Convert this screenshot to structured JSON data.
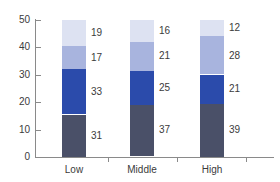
{
  "chart_data": {
    "type": "bar",
    "stacked": true,
    "title": "",
    "subtitle": "",
    "xlabel": "",
    "ylabel": "",
    "ylim": [
      0,
      50
    ],
    "yticks": [
      0,
      10,
      20,
      30,
      40,
      50
    ],
    "ytick_labels": [
      "0",
      "10",
      "20",
      "30",
      "40",
      "50"
    ],
    "grid": false,
    "legend": "none",
    "categories": [
      "Low",
      "Middle",
      "High"
    ],
    "series": [
      {
        "name": "series-1-bottom",
        "color": "#4a5068",
        "values": [
          31,
          37,
          39
        ]
      },
      {
        "name": "series-2",
        "color": "#2b4bab",
        "values": [
          33,
          25,
          21
        ]
      },
      {
        "name": "series-3",
        "color": "#a8b4de",
        "values": [
          17,
          21,
          28
        ]
      },
      {
        "name": "series-4-top",
        "color": "#dde2f2",
        "values": [
          19,
          16,
          12
        ]
      }
    ],
    "bars": [
      {
        "category": "Low",
        "segments": [
          {
            "label": "19",
            "value": 19,
            "color": "#dde2f2"
          },
          {
            "label": "17",
            "value": 17,
            "color": "#a8b4de"
          },
          {
            "label": "33",
            "value": 33,
            "color": "#2b4bab"
          },
          {
            "label": "31",
            "value": 31,
            "color": "#4a5068"
          }
        ]
      },
      {
        "category": "Middle",
        "segments": [
          {
            "label": "16",
            "value": 16,
            "color": "#dde2f2"
          },
          {
            "label": "21",
            "value": 21,
            "color": "#a8b4de"
          },
          {
            "label": "25",
            "value": 25,
            "color": "#2b4bab"
          },
          {
            "label": "37",
            "value": 37,
            "color": "#4a5068"
          }
        ]
      },
      {
        "category": "High",
        "segments": [
          {
            "label": "12",
            "value": 12,
            "color": "#dde2f2"
          },
          {
            "label": "28",
            "value": 28,
            "color": "#a8b4de"
          },
          {
            "label": "21",
            "value": 21,
            "color": "#2b4bab"
          },
          {
            "label": "39",
            "value": 39,
            "color": "#4a5068"
          }
        ]
      }
    ],
    "axis_color": "#8a8a8a",
    "text_color": "#3b3b3b",
    "background": "#ffffff"
  }
}
